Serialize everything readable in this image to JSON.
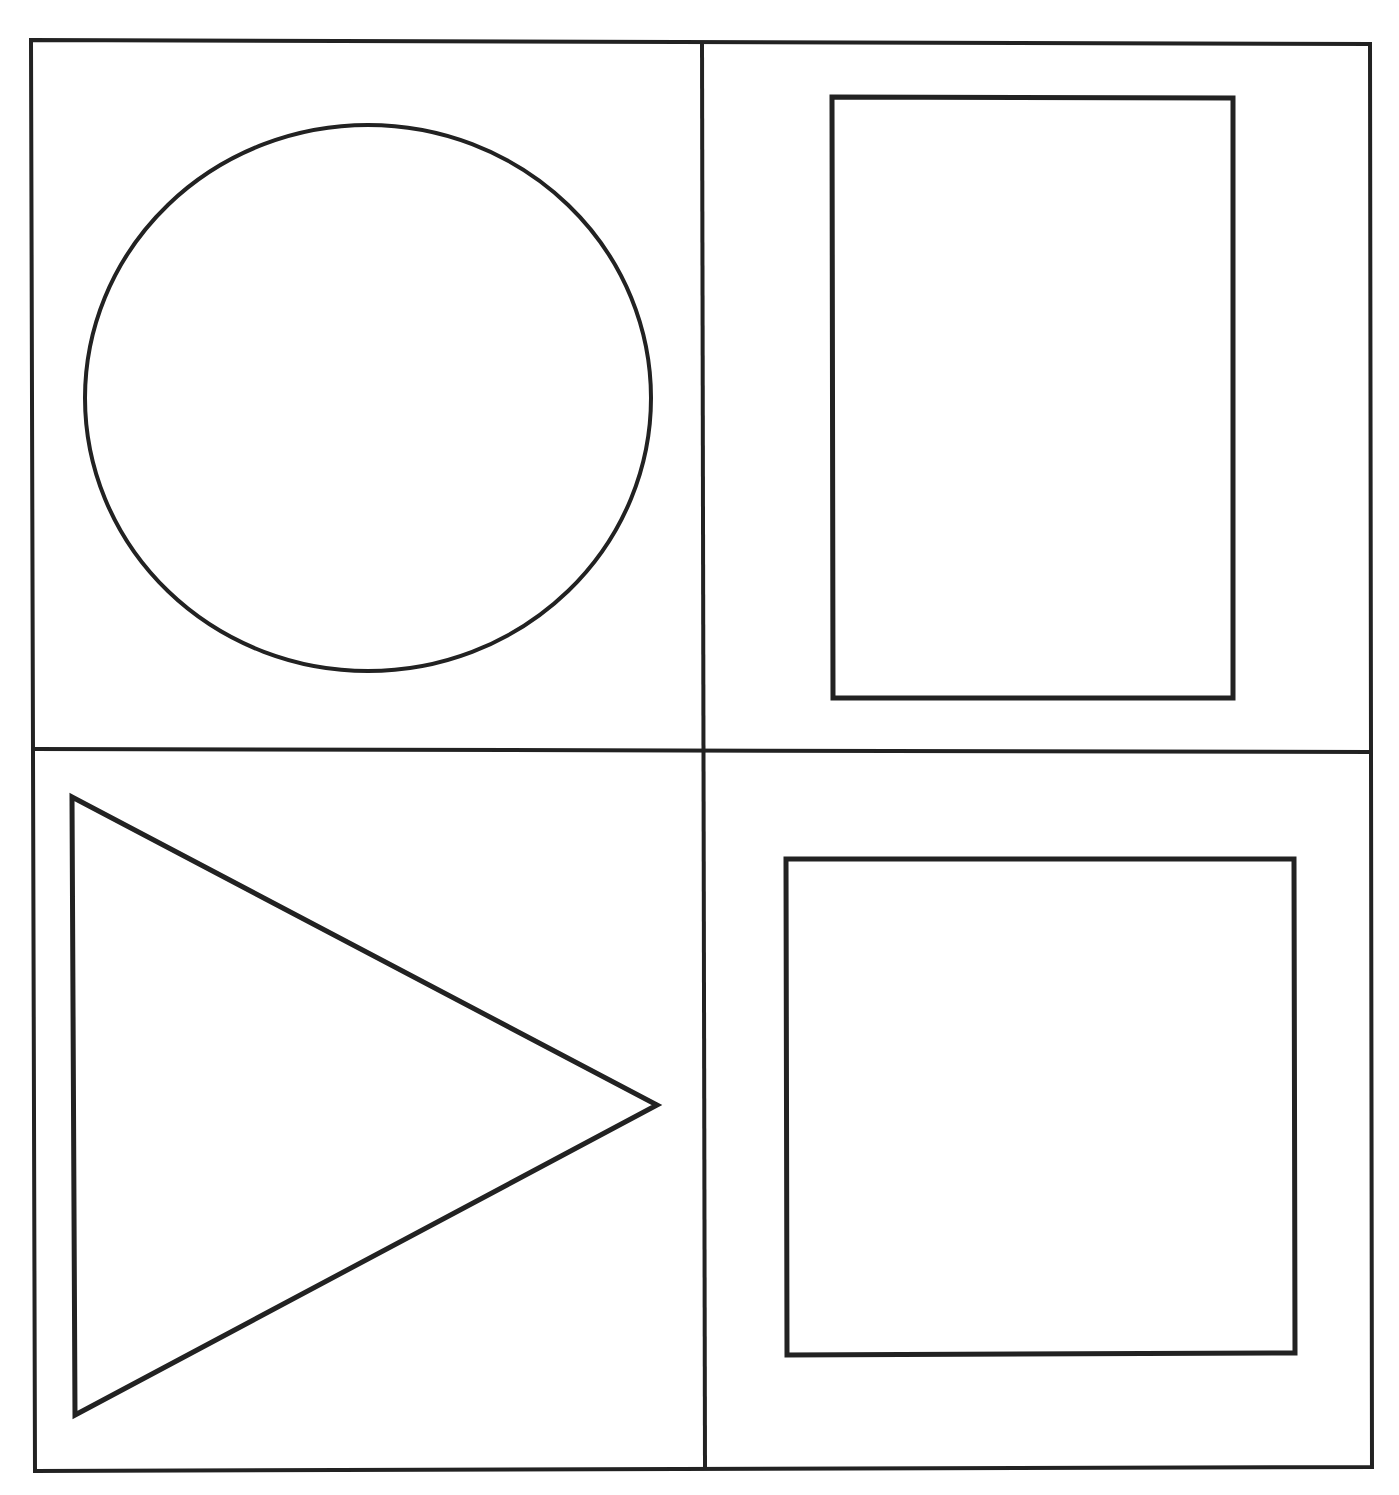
{
  "page": {
    "width": 1399,
    "height": 1495,
    "background": "#ffffff",
    "stroke_color": "#222222"
  },
  "frame": {
    "points": [
      [
        31,
        40
      ],
      [
        1370,
        44
      ],
      [
        1372,
        1467
      ],
      [
        35,
        1471
      ]
    ],
    "stroke_width": 4
  },
  "dividers": {
    "vertical": {
      "x1": 702,
      "y1": 42,
      "x2": 705,
      "y2": 1469,
      "stroke_width": 4
    },
    "horizontal": {
      "x1": 33,
      "y1": 749,
      "x2": 1371,
      "y2": 752,
      "stroke_width": 4
    }
  },
  "shapes": [
    {
      "quadrant": "top-left",
      "type": "circle",
      "label": "circle",
      "cx": 368,
      "cy": 398,
      "rx": 283,
      "ry": 273,
      "stroke_width": 4
    },
    {
      "quadrant": "top-right",
      "type": "rectangle",
      "label": "tall-rectangle",
      "points": [
        [
          832,
          97
        ],
        [
          1233,
          98
        ],
        [
          1233,
          698
        ],
        [
          833,
          698
        ]
      ],
      "stroke_width": 5
    },
    {
      "quadrant": "bottom-left",
      "type": "triangle",
      "label": "right-pointing-triangle",
      "points": [
        [
          72,
          797
        ],
        [
          657,
          1105
        ],
        [
          75,
          1415
        ]
      ],
      "stroke_width": 5
    },
    {
      "quadrant": "bottom-right",
      "type": "square",
      "label": "square",
      "points": [
        [
          786,
          859
        ],
        [
          1294,
          859
        ],
        [
          1295,
          1353
        ],
        [
          787,
          1355
        ]
      ],
      "stroke_width": 5
    }
  ]
}
